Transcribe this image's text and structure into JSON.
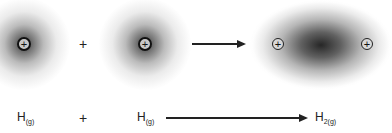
{
  "diagram": {
    "type": "reaction-electron-cloud",
    "top_row": {
      "atom1": {
        "nucleus_symbol": "+"
      },
      "operator": "+",
      "atom2": {
        "nucleus_symbol": "+"
      },
      "molecule": {
        "nucleus_left_symbol": "+",
        "nucleus_right_symbol": "+"
      }
    },
    "bottom_row": {
      "reactant1": {
        "element": "H",
        "state": "(g)"
      },
      "operator": "+",
      "reactant2": {
        "element": "H",
        "state": "(g)"
      },
      "product": {
        "element": "H",
        "state": "2(g)"
      }
    },
    "colors": {
      "ink": "#222222",
      "background": "#ffffff"
    }
  }
}
